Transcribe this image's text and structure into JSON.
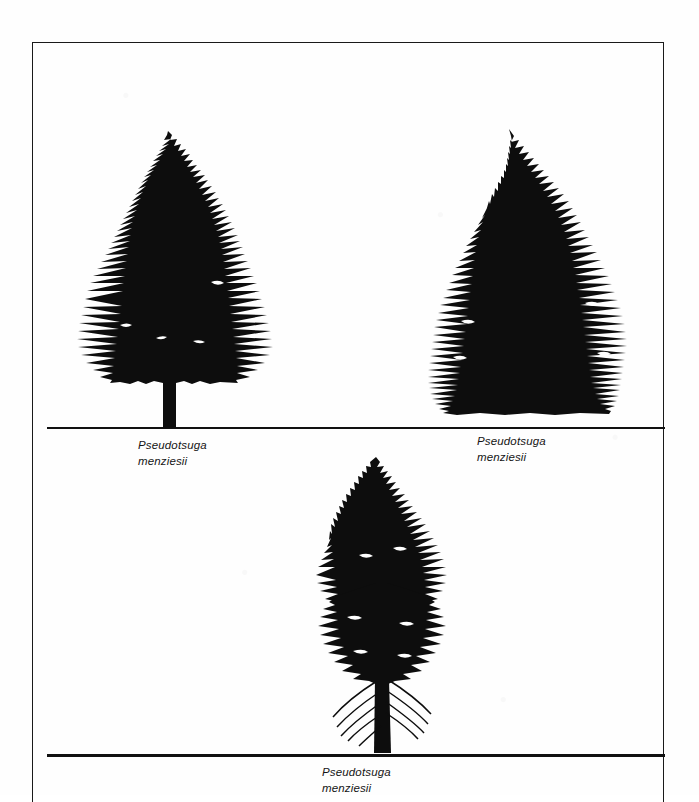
{
  "plate": {
    "background_color": "#ffffff",
    "ink_color": "#111111",
    "frame": {
      "border_color": "#1a1a1a",
      "border_width_px": 1.6
    }
  },
  "figures": [
    {
      "id": "figure-left",
      "position": "upper-left",
      "subject": "douglas-fir-open-grown-form",
      "silhouette_color": "#0d0d0d",
      "has_visible_trunk": true,
      "ground_rule": "ground-upper",
      "caption": {
        "genus": "Pseudotsuga",
        "species": "menziesii"
      }
    },
    {
      "id": "figure-right",
      "position": "upper-right",
      "subject": "douglas-fir-dense-conical-form",
      "silhouette_color": "#0d0d0d",
      "has_visible_trunk": false,
      "ground_rule": "ground-upper",
      "caption": {
        "genus": "Pseudotsuga",
        "species": "menziesii"
      }
    },
    {
      "id": "figure-bottom",
      "position": "lower-center",
      "subject": "douglas-fir-mature-forest-form",
      "silhouette_color": "#0d0d0d",
      "has_visible_trunk": true,
      "ground_rule": "ground-lower",
      "caption": {
        "genus": "Pseudotsuga",
        "species": "menziesii"
      }
    }
  ],
  "ground_rules": [
    {
      "id": "ground-upper",
      "color": "#111111"
    },
    {
      "id": "ground-lower",
      "color": "#111111"
    }
  ]
}
